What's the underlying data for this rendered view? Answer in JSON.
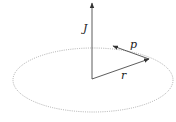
{
  "diagram": {
    "type": "vector-diagram",
    "labels": {
      "angular_momentum": "J",
      "momentum": "p",
      "position": "r"
    },
    "colors": {
      "vector": "#333333",
      "orbit": "#9a9a9a",
      "text": "#222222"
    },
    "orbit": {
      "style": "dotted",
      "shape": "ellipse"
    }
  }
}
